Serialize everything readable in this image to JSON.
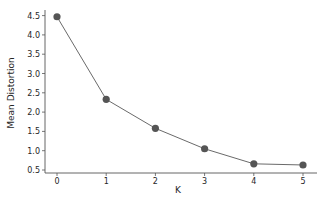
{
  "chart_data": {
    "type": "line",
    "title": "",
    "xlabel": "K",
    "ylabel": "Mean Distortion",
    "x": [
      0,
      1,
      2,
      3,
      4,
      5
    ],
    "series": [
      {
        "name": "Mean Distortion",
        "values": [
          4.47,
          2.33,
          1.58,
          1.05,
          0.66,
          0.63
        ],
        "color": "#555555",
        "marker": "circle"
      }
    ],
    "xticks": [
      "0",
      "1",
      "2",
      "3",
      "4",
      "5"
    ],
    "yticks": [
      "0.5",
      "1.0",
      "1.5",
      "2.0",
      "2.5",
      "3.0",
      "3.5",
      "4.0",
      "4.5"
    ],
    "xlim": [
      -0.3,
      5.3
    ],
    "ylim": [
      0.42,
      4.6
    ],
    "grid": false,
    "legend": null
  }
}
